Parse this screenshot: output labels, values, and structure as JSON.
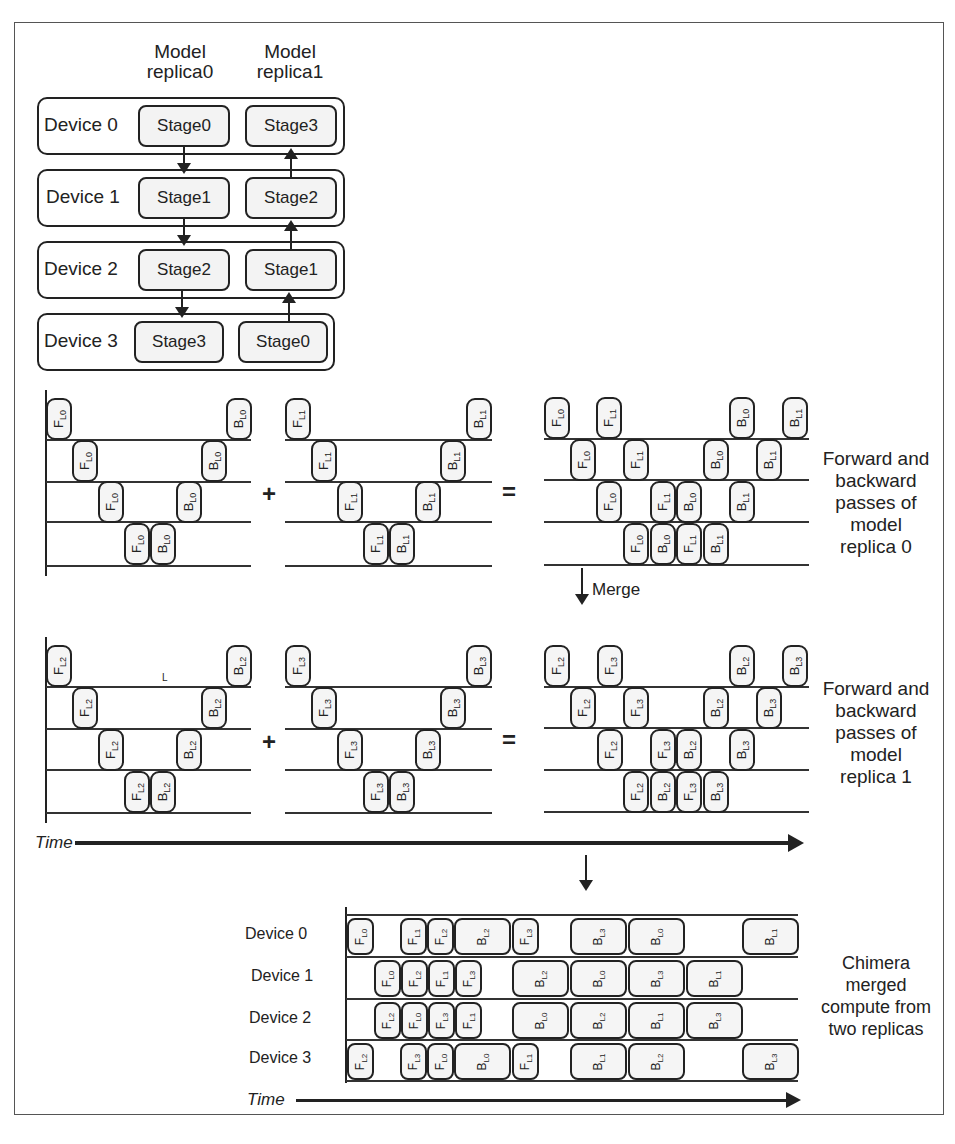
{
  "top_diagram": {
    "columns": [
      "Model\nreplica0",
      "Model\nreplica1"
    ],
    "column_line1": [
      "Model",
      "Model"
    ],
    "column_line2": [
      "replica0",
      "replica1"
    ],
    "devices": [
      {
        "label": "Device 0",
        "replica0": "Stage0",
        "replica1": "Stage3"
      },
      {
        "label": "Device 1",
        "replica0": "Stage1",
        "replica1": "Stage2"
      },
      {
        "label": "Device 2",
        "replica0": "Stage2",
        "replica1": "Stage1"
      },
      {
        "label": "Device 3",
        "replica0": "Stage3",
        "replica1": "Stage0"
      }
    ],
    "replica0_flow": "down",
    "replica1_flow": "up"
  },
  "pipelines": {
    "plus": "+",
    "equals": "=",
    "replica0_caption": "Forward and backward passes of model replica 0",
    "replica0_caption_lines": [
      "Forward and",
      "backward",
      "passes of",
      "model",
      "replica 0"
    ],
    "replica1_caption_lines": [
      "Forward and",
      "backward",
      "passes of",
      "model",
      "replica 1"
    ],
    "merge_label": "Merge",
    "stray_mark": "L",
    "time_label": "Time",
    "microbatch_labels": {
      "L0": "L0",
      "L1": "L1",
      "L2": "L2",
      "L3": "L3"
    }
  },
  "chimera": {
    "device_labels": [
      "Device 0",
      "Device 1",
      "Device 2",
      "Device 3"
    ],
    "caption_lines": [
      "Chimera",
      "merged",
      "compute from",
      "two replicas"
    ],
    "time_label": "Time",
    "schedule": [
      [
        {
          "op": "F",
          "mb": "L0",
          "x": 347,
          "w": 27
        },
        {
          "op": "F",
          "mb": "L1",
          "x": 400,
          "w": 27
        },
        {
          "op": "F",
          "mb": "L2",
          "x": 427,
          "w": 27
        },
        {
          "op": "B",
          "mb": "L2",
          "x": 454,
          "w": 57
        },
        {
          "op": "F",
          "mb": "L3",
          "x": 512,
          "w": 27
        },
        {
          "op": "B",
          "mb": "L3",
          "x": 570,
          "w": 57
        },
        {
          "op": "B",
          "mb": "L0",
          "x": 628,
          "w": 57
        },
        {
          "op": "B",
          "mb": "L1",
          "x": 742,
          "w": 57
        }
      ],
      [
        {
          "op": "F",
          "mb": "L0",
          "x": 374,
          "w": 27
        },
        {
          "op": "F",
          "mb": "L2",
          "x": 401,
          "w": 27
        },
        {
          "op": "F",
          "mb": "L1",
          "x": 428,
          "w": 27
        },
        {
          "op": "F",
          "mb": "L3",
          "x": 455,
          "w": 27
        },
        {
          "op": "B",
          "mb": "L2",
          "x": 512,
          "w": 57
        },
        {
          "op": "B",
          "mb": "L0",
          "x": 570,
          "w": 57
        },
        {
          "op": "B",
          "mb": "L3",
          "x": 628,
          "w": 57
        },
        {
          "op": "B",
          "mb": "L1",
          "x": 686,
          "w": 57
        }
      ],
      [
        {
          "op": "F",
          "mb": "L2",
          "x": 374,
          "w": 27
        },
        {
          "op": "F",
          "mb": "L0",
          "x": 401,
          "w": 27
        },
        {
          "op": "F",
          "mb": "L3",
          "x": 428,
          "w": 27
        },
        {
          "op": "F",
          "mb": "L1",
          "x": 455,
          "w": 27
        },
        {
          "op": "B",
          "mb": "L0",
          "x": 512,
          "w": 57
        },
        {
          "op": "B",
          "mb": "L2",
          "x": 570,
          "w": 57
        },
        {
          "op": "B",
          "mb": "L1",
          "x": 628,
          "w": 57
        },
        {
          "op": "B",
          "mb": "L3",
          "x": 686,
          "w": 57
        }
      ],
      [
        {
          "op": "F",
          "mb": "L2",
          "x": 347,
          "w": 27
        },
        {
          "op": "F",
          "mb": "L3",
          "x": 400,
          "w": 27
        },
        {
          "op": "F",
          "mb": "L0",
          "x": 427,
          "w": 27
        },
        {
          "op": "B",
          "mb": "L0",
          "x": 454,
          "w": 57
        },
        {
          "op": "F",
          "mb": "L1",
          "x": 512,
          "w": 27
        },
        {
          "op": "B",
          "mb": "L1",
          "x": 570,
          "w": 57
        },
        {
          "op": "B",
          "mb": "L2",
          "x": 628,
          "w": 57
        },
        {
          "op": "B",
          "mb": "L3",
          "x": 742,
          "w": 57
        }
      ]
    ]
  },
  "caption": "Figure  Chimera pipeline: bidirectional pipelines merged across two model replicas"
}
